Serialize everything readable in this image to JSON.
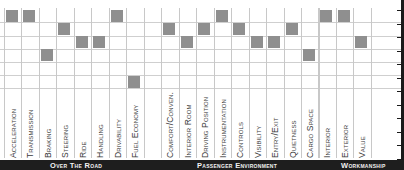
{
  "chart_data": {
    "type": "heatmap",
    "title": "",
    "rows": 6,
    "row_scale": "1 = top row (best), 6 = bottom row (worst)",
    "groups": [
      {
        "name": "Over The Road",
        "categories": [
          "Acceleration",
          "Transmission",
          "Braking",
          "Steering",
          "Ride",
          "Handling",
          "Drivability",
          "Fuel Economy"
        ],
        "values": [
          1,
          1,
          4,
          2,
          3,
          3,
          1,
          6
        ]
      },
      {
        "name": "Passenger Environment",
        "categories": [
          "Comfort/Conven.",
          "Interior Room",
          "Driving Position",
          "Instrumentation",
          "Controls",
          "Visibility",
          "Entry/Exit",
          "Quietness",
          "Cargo Space"
        ],
        "values": [
          2,
          3,
          2,
          1,
          2,
          3,
          3,
          2,
          4
        ]
      },
      {
        "name": "Workmanship",
        "categories": [
          "Interior",
          "Exterior",
          "Value"
        ],
        "values": [
          1,
          1,
          3
        ]
      }
    ],
    "grid": true,
    "legend": null
  },
  "layout": {
    "col_x": [
      4,
      21,
      39,
      56,
      74,
      91,
      109,
      126,
      161,
      179,
      196,
      214,
      231,
      249,
      266,
      284,
      301,
      318,
      336,
      353
    ],
    "row_y": [
      10,
      23,
      36,
      49,
      62,
      76
    ],
    "grid_bottom": 88,
    "square_color": "#8f8f8f",
    "footer_color": "#1e1e1e"
  },
  "footer": {
    "sections": [
      "Over The Road",
      "Passenger Environment",
      "Workmanship"
    ]
  }
}
